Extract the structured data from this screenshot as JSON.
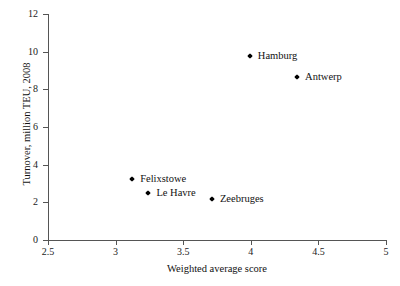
{
  "chart_data": {
    "type": "scatter",
    "title": "",
    "xlabel": "Weighted average score",
    "ylabel": "Turnover, million TEU, 2008",
    "xlim": [
      2.5,
      5
    ],
    "ylim": [
      0,
      12
    ],
    "grid": false,
    "legend": "none",
    "xticks": [
      "2.5",
      "3",
      "3.5",
      "4",
      "4.5",
      "5"
    ],
    "xtick_values": [
      2.5,
      3,
      3.5,
      4,
      4.5,
      5
    ],
    "yticks": [
      "0",
      "2",
      "4",
      "6",
      "8",
      "10",
      "12"
    ],
    "ytick_values": [
      0,
      2,
      4,
      6,
      8,
      10,
      12
    ],
    "marker": "diamond",
    "marker_color": "#000000",
    "points": [
      {
        "label": "Hamburg",
        "x": 4.0,
        "y": 9.7,
        "label_position": "right"
      },
      {
        "label": "Antwerp",
        "x": 4.35,
        "y": 8.6,
        "label_position": "right"
      },
      {
        "label": "Felixstowe",
        "x": 3.13,
        "y": 3.2,
        "label_position": "right"
      },
      {
        "label": "Le Havre",
        "x": 3.25,
        "y": 2.45,
        "label_position": "right"
      },
      {
        "label": "Zeebruges",
        "x": 3.72,
        "y": 2.1,
        "label_position": "right"
      }
    ]
  },
  "axes": {
    "x_title": "Weighted average score",
    "y_title": "Turnover, million TEU, 2008"
  },
  "ticks": {
    "x": [
      {
        "label": "2.5"
      },
      {
        "label": "3"
      },
      {
        "label": "3.5"
      },
      {
        "label": "4"
      },
      {
        "label": "4.5"
      },
      {
        "label": "5"
      }
    ],
    "y": [
      {
        "label": "12"
      },
      {
        "label": "10"
      },
      {
        "label": "8"
      },
      {
        "label": "6"
      },
      {
        "label": "4"
      },
      {
        "label": "2"
      },
      {
        "label": "0"
      }
    ]
  },
  "style": {
    "axis_color": "#555555",
    "text_color": "#111111",
    "marker_color": "#000000",
    "background": "#ffffff"
  }
}
